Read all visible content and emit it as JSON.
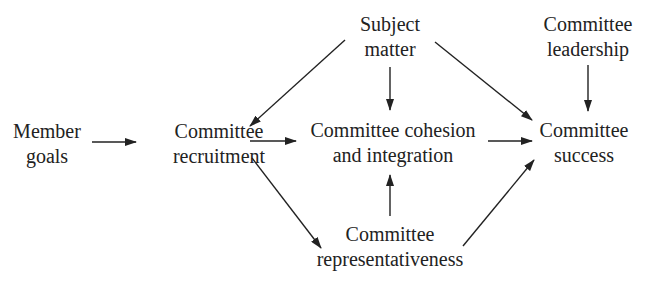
{
  "diagram": {
    "type": "causal-flow",
    "nodes": [
      {
        "id": "member_goals",
        "lines": [
          "Member",
          "goals"
        ]
      },
      {
        "id": "recruitment",
        "lines": [
          "Committee",
          "recruitment"
        ]
      },
      {
        "id": "subject_matter",
        "lines": [
          "Subject",
          "matter"
        ]
      },
      {
        "id": "cohesion",
        "lines": [
          "Committee cohesion",
          "and integration"
        ]
      },
      {
        "id": "leadership",
        "lines": [
          "Committee",
          "leadership"
        ]
      },
      {
        "id": "success",
        "lines": [
          "Committee",
          "success"
        ]
      },
      {
        "id": "representativeness",
        "lines": [
          "Committee",
          "representativeness"
        ]
      }
    ],
    "edges": [
      {
        "from": "member_goals",
        "to": "recruitment"
      },
      {
        "from": "subject_matter",
        "to": "recruitment"
      },
      {
        "from": "subject_matter",
        "to": "cohesion"
      },
      {
        "from": "subject_matter",
        "to": "success"
      },
      {
        "from": "leadership",
        "to": "success"
      },
      {
        "from": "recruitment",
        "to": "cohesion"
      },
      {
        "from": "cohesion",
        "to": "success"
      },
      {
        "from": "recruitment",
        "to": "representativeness"
      },
      {
        "from": "representativeness",
        "to": "cohesion"
      },
      {
        "from": "representativeness",
        "to": "success"
      }
    ],
    "colors": {
      "ink": "#222222",
      "background": "#ffffff"
    }
  }
}
